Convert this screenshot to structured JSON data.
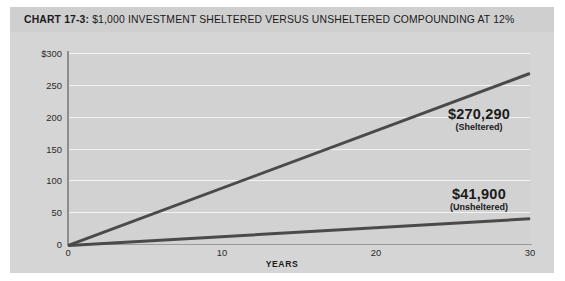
{
  "chart_data": {
    "type": "line",
    "title": "CHART 17-3: $1,000 INVESTMENT SHELTERED VERSUS UNSHELTERED COMPOUNDING AT 12%",
    "title_lead": "CHART 17-3:",
    "title_rest": " $1,000 INVESTMENT SHELTERED VERSUS UNSHELTERED COMPOUNDING AT 12%",
    "xlabel": "YEARS",
    "ylabel": "",
    "xlim": [
      0,
      30
    ],
    "ylim": [
      0,
      300
    ],
    "grid": true,
    "legend_position": "inline-annotations",
    "x_ticks": [
      {
        "value": 0,
        "label": "0"
      },
      {
        "value": 10,
        "label": "10"
      },
      {
        "value": 20,
        "label": "20"
      },
      {
        "value": 30,
        "label": "30"
      }
    ],
    "y_ticks": [
      {
        "value": 300,
        "label": "$300"
      },
      {
        "value": 250,
        "label": "250"
      },
      {
        "value": 200,
        "label": "200"
      },
      {
        "value": 150,
        "label": "150"
      },
      {
        "value": 100,
        "label": "100"
      },
      {
        "value": 50,
        "label": "50"
      },
      {
        "value": 0,
        "label": "0"
      }
    ],
    "x": [
      0,
      30
    ],
    "series": [
      {
        "name": "Sheltered",
        "color": "#4a4a4a",
        "values": [
          0,
          270.29
        ],
        "end_value_label": "$270,290",
        "end_caption": "(Sheltered)"
      },
      {
        "name": "Unsheltered",
        "color": "#4a4a4a",
        "values": [
          0,
          41.9
        ],
        "end_value_label": "$41,900",
        "end_caption": "(Unsheltered)"
      }
    ],
    "annotations": [
      {
        "value": "$270,290",
        "caption": "(Sheltered)"
      },
      {
        "value": "$41,900",
        "caption": "(Unsheltered)"
      }
    ]
  },
  "colors": {
    "figure_background": "#d5d5d5",
    "title_band": "#cfcfcf",
    "plot_background": "#d2d2d2",
    "gridline": "#f2f2f2",
    "axis": "#8d8d8d",
    "line": "#4a4a4a",
    "text": "#1a1a1a"
  }
}
